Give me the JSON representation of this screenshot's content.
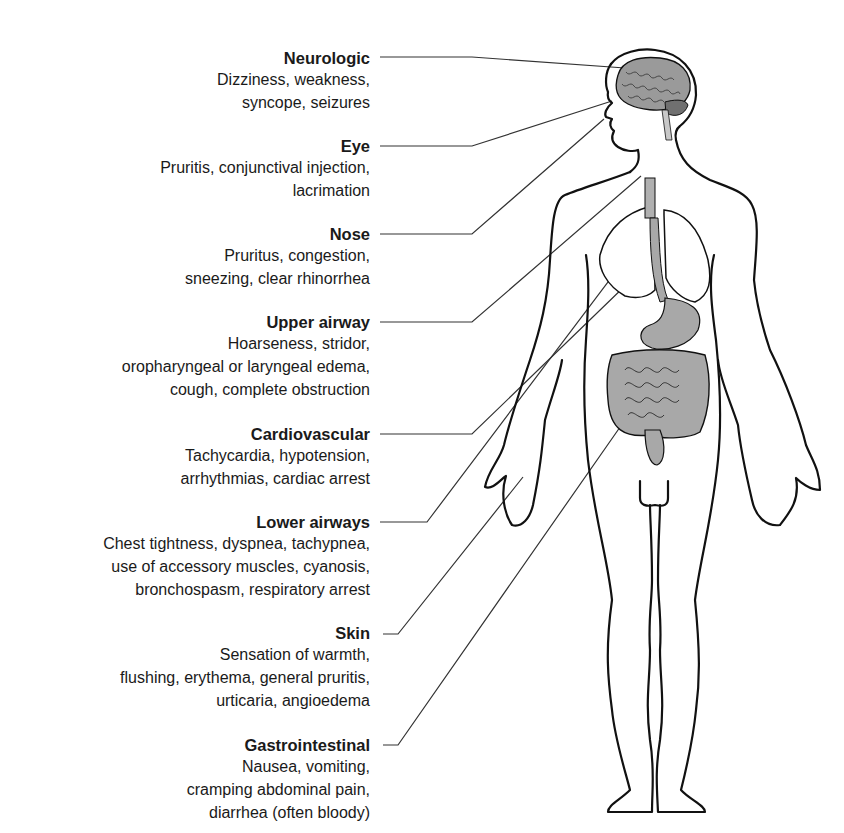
{
  "diagram": {
    "systems": [
      {
        "title": "Neurologic",
        "lines": [
          "Dizziness, weakness,",
          "syncope, seizures"
        ]
      },
      {
        "title": "Eye",
        "lines": [
          "Pruritis, conjunctival injection,",
          "lacrimation"
        ]
      },
      {
        "title": "Nose",
        "lines": [
          "Pruritus, congestion,",
          "sneezing, clear rhinorrhea"
        ]
      },
      {
        "title": "Upper airway",
        "lines": [
          "Hoarseness, stridor,",
          "oropharyngeal or laryngeal edema,",
          "cough, complete obstruction"
        ]
      },
      {
        "title": "Cardiovascular",
        "lines": [
          "Tachycardia, hypotension,",
          "arrhythmias, cardiac arrest"
        ]
      },
      {
        "title": "Lower airways",
        "lines": [
          "Chest tightness, dyspnea, tachypnea,",
          "use of accessory muscles, cyanosis,",
          "bronchospasm, respiratory arrest"
        ]
      },
      {
        "title": "Skin",
        "lines": [
          "Sensation of warmth,",
          "flushing, erythema, general pruritis,",
          "urticaria, angioedema"
        ]
      },
      {
        "title": "Gastrointestinal",
        "lines": [
          "Nausea, vomiting,",
          "cramping abdominal pain,",
          "diarrhea (often bloody)"
        ]
      }
    ],
    "colors": {
      "line": "#1a1a1a",
      "organ_fill": "#a8a8a8",
      "organ_dark": "#6e6e6e",
      "background": "#ffffff"
    }
  }
}
